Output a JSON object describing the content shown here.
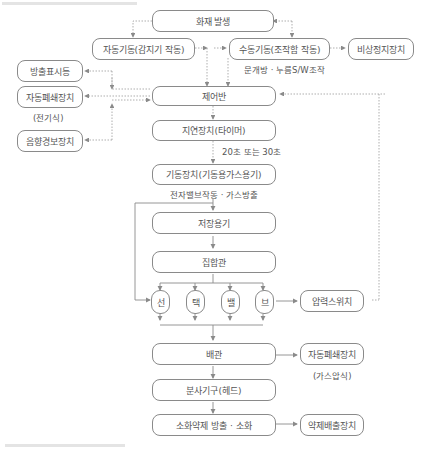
{
  "diagram": {
    "nodes": {
      "fire": "화재 발생",
      "auto_start": "자동기동(감지기 작동)",
      "manual_start": "수동기동(조작함 작동)",
      "emergency_stop": "비상정지장치",
      "discharge_lamp": "방출표시등",
      "auto_close_electric": "자동폐쇄장치",
      "control_panel": "제어반",
      "alarm": "음향경보장치",
      "delay": "지연장치(타이머)",
      "starter": "기동장치(기동용가스용기)",
      "storage": "저장용기",
      "manifold": "집합관",
      "valve_1": "선",
      "valve_2": "택",
      "valve_3": "밸",
      "valve_4": "브",
      "pressure_switch": "압력스위치",
      "piping": "배관",
      "auto_close_gas": "자동폐쇄장치",
      "nozzle": "분사기구(헤드)",
      "discharge": "소화약제 방출 · 소화",
      "exhaust": "약제배출장치"
    },
    "annotations": {
      "manual_note": "문개방 · 누름S/W조작",
      "electric_type": "(전기식)",
      "delay_time": "20초 또는 30초",
      "starter_note": "전자밸브작동 · 가스방출",
      "gas_type": "(가스압식)"
    },
    "colors": {
      "border": "#8a8a8a",
      "line": "#8a8a8a",
      "text": "#555555"
    }
  }
}
